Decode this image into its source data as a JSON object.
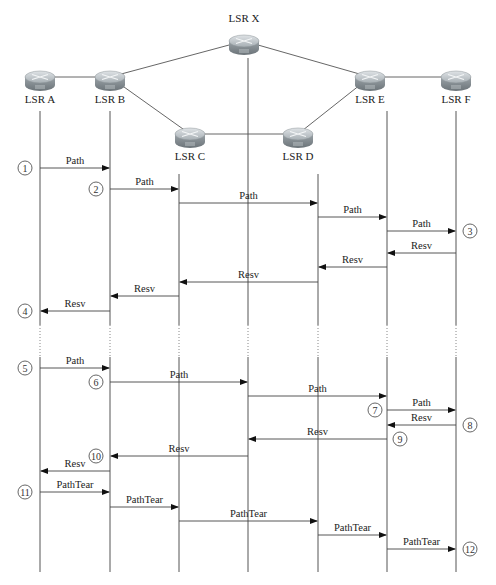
{
  "nodes": [
    {
      "id": "A",
      "label": "LSR A",
      "x": 40,
      "y": 77,
      "label_y": 103,
      "lifeline_top": 111
    },
    {
      "id": "B",
      "label": "LSR B",
      "x": 110,
      "y": 77,
      "label_y": 103,
      "lifeline_top": 111
    },
    {
      "id": "C",
      "label": "LSR C",
      "x": 190,
      "y": 134,
      "label_y": 160,
      "lifeline_top": 174,
      "lifeline_x": 179
    },
    {
      "id": "X",
      "label": "LSR X",
      "x": 244,
      "y": 41,
      "label_y": 22,
      "lifeline_top": 58,
      "lifeline_x": 248
    },
    {
      "id": "D",
      "label": "LSR D",
      "x": 298,
      "y": 134,
      "label_y": 160,
      "lifeline_top": 174,
      "lifeline_x": 318
    },
    {
      "id": "E",
      "label": "LSR E",
      "x": 370,
      "y": 77,
      "label_y": 103,
      "lifeline_top": 111,
      "lifeline_x": 387
    },
    {
      "id": "F",
      "label": "LSR F",
      "x": 456,
      "y": 77,
      "label_y": 103,
      "lifeline_top": 111
    }
  ],
  "links": [
    {
      "from": "A",
      "to": "B"
    },
    {
      "from": "B",
      "to": "X"
    },
    {
      "from": "B",
      "to": "C"
    },
    {
      "from": "C",
      "to": "D"
    },
    {
      "from": "X",
      "to": "E"
    },
    {
      "from": "D",
      "to": "E"
    },
    {
      "from": "E",
      "to": "F"
    }
  ],
  "lifeline_x": {
    "A": 40,
    "B": 110,
    "C": 179,
    "X": 248,
    "D": 318,
    "E": 387,
    "F": 456
  },
  "lifeline_gap": {
    "y1": 325,
    "y2": 357
  },
  "lifeline_bottom": 572,
  "messages": [
    {
      "label": "Path",
      "from": "A",
      "to": "B",
      "y": 168
    },
    {
      "label": "Path",
      "from": "B",
      "to": "C",
      "y": 189
    },
    {
      "label": "Path",
      "from": "C",
      "to": "D",
      "y": 203
    },
    {
      "label": "Path",
      "from": "D",
      "to": "E",
      "y": 217
    },
    {
      "label": "Path",
      "from": "E",
      "to": "F",
      "y": 231
    },
    {
      "label": "Resv",
      "from": "F",
      "to": "E",
      "y": 253
    },
    {
      "label": "Resv",
      "from": "E",
      "to": "D",
      "y": 267
    },
    {
      "label": "Resv",
      "from": "D",
      "to": "C",
      "y": 282
    },
    {
      "label": "Resv",
      "from": "C",
      "to": "B",
      "y": 296
    },
    {
      "label": "Resv",
      "from": "B",
      "to": "A",
      "y": 311
    },
    {
      "label": "Path",
      "from": "A",
      "to": "B",
      "y": 368
    },
    {
      "label": "Path",
      "from": "B",
      "to": "X",
      "y": 382
    },
    {
      "label": "Path",
      "from": "X",
      "to": "E",
      "y": 396
    },
    {
      "label": "Path",
      "from": "E",
      "to": "F",
      "y": 410
    },
    {
      "label": "Resv",
      "from": "F",
      "to": "E",
      "y": 425
    },
    {
      "label": "Resv",
      "from": "E",
      "to": "X",
      "y": 439
    },
    {
      "label": "Resv",
      "from": "X",
      "to": "B",
      "y": 456
    },
    {
      "label": "Resv",
      "from": "B",
      "to": "A",
      "y": 471
    },
    {
      "label": "PathTear",
      "from": "A",
      "to": "B",
      "y": 492
    },
    {
      "label": "PathTear",
      "from": "B",
      "to": "C",
      "y": 507
    },
    {
      "label": "PathTear",
      "from": "C",
      "to": "D",
      "y": 521
    },
    {
      "label": "PathTear",
      "from": "D",
      "to": "E",
      "y": 535
    },
    {
      "label": "PathTear",
      "from": "E",
      "to": "F",
      "y": 549
    }
  ],
  "steps": [
    {
      "num": "1",
      "x": 25,
      "y": 168
    },
    {
      "num": "2",
      "x": 96,
      "y": 189
    },
    {
      "num": "3",
      "x": 470,
      "y": 231
    },
    {
      "num": "4",
      "x": 25,
      "y": 311
    },
    {
      "num": "5",
      "x": 25,
      "y": 368
    },
    {
      "num": "6",
      "x": 96,
      "y": 382
    },
    {
      "num": "7",
      "x": 375,
      "y": 410
    },
    {
      "num": "8",
      "x": 470,
      "y": 425
    },
    {
      "num": "9",
      "x": 400,
      "y": 439
    },
    {
      "num": "10",
      "x": 96,
      "y": 456
    },
    {
      "num": "11",
      "x": 25,
      "y": 492
    },
    {
      "num": "12",
      "x": 470,
      "y": 549
    }
  ],
  "colors": {
    "router_top": "#c8cdd1",
    "router_body": "#8e979d",
    "router_dark": "#6b7479",
    "line": "#555555"
  }
}
